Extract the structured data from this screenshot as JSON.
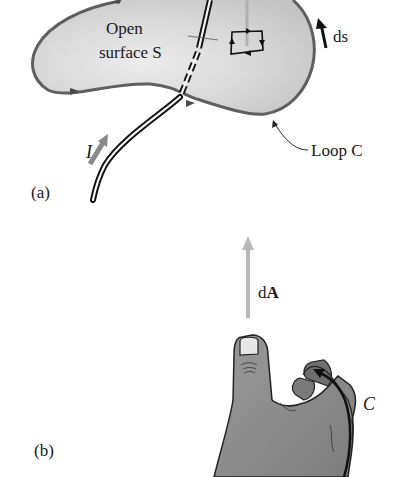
{
  "figure": {
    "panel_a": {
      "label": "(a)",
      "surface_label_line1": "Open",
      "surface_label_line2": "surface S",
      "surface_label_italic": "S",
      "loop_label": "Loop C",
      "ds_label": "ds",
      "current_label": "I"
    },
    "panel_b": {
      "label": "(b)",
      "dA_label_prefix": "d",
      "dA_label_bold": "A",
      "curve_label": "C"
    },
    "colors": {
      "surface_fill": "#d4d4d4",
      "loop_outline": "#5f5f5f",
      "wire": "#111111",
      "current_arrow": "#8a8a8a",
      "dA_arrow": "#b8b8b8",
      "hand_fill": "#8c8c8c",
      "text": "#1a1a1a"
    }
  }
}
